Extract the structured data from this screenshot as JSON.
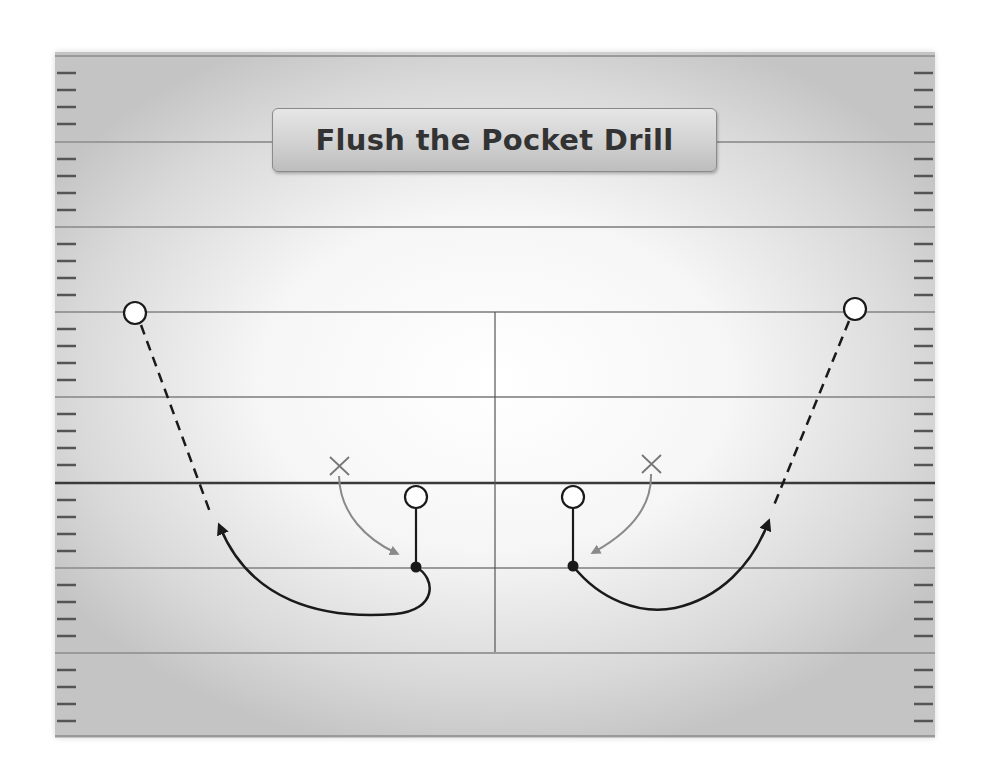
{
  "diagram": {
    "title": "Flush the Pocket Drill",
    "type": "football-drill",
    "colors": {
      "yard_line": "#9a9a9a",
      "scrimmage_line": "#3a3a3a",
      "hash": "#555555",
      "route": "#1a1a1a",
      "defender_path": "#8a8a8a",
      "player_outline": "#1a1a1a"
    },
    "field": {
      "yard_lines_y": [
        56,
        142,
        227,
        312,
        397,
        568,
        653,
        736
      ],
      "line_of_scrimmage_y": 483,
      "center_line": {
        "x": 495,
        "y1": 312,
        "y2": 652
      }
    },
    "players": [
      {
        "id": "left-receiver",
        "symbol": "O",
        "x": 135,
        "y": 313
      },
      {
        "id": "right-receiver",
        "symbol": "O",
        "x": 855,
        "y": 309
      },
      {
        "id": "left-quarterback",
        "symbol": "O",
        "x": 416,
        "y": 497
      },
      {
        "id": "right-quarterback",
        "symbol": "O",
        "x": 573,
        "y": 497
      },
      {
        "id": "left-defender",
        "symbol": "X",
        "x": 340,
        "y": 466
      },
      {
        "id": "right-defender",
        "symbol": "X",
        "x": 652,
        "y": 464
      }
    ],
    "routes": [
      {
        "id": "left-qb-drop",
        "style": "solid",
        "from": "left-quarterback",
        "to": [
          416,
          567
        ]
      },
      {
        "id": "right-qb-drop",
        "style": "solid",
        "from": "right-quarterback",
        "to": [
          573,
          566
        ]
      },
      {
        "id": "left-qb-scramble",
        "style": "solid-arrow",
        "description": "QB rolls out left after drop"
      },
      {
        "id": "right-qb-scramble",
        "style": "solid-arrow",
        "description": "QB rolls out right after drop"
      },
      {
        "id": "left-pass",
        "style": "dashed",
        "description": "Throw to left receiver"
      },
      {
        "id": "right-pass",
        "style": "dashed",
        "description": "Throw to right receiver"
      },
      {
        "id": "left-rush",
        "style": "gray-arrow",
        "description": "Defender pressure toward QB"
      },
      {
        "id": "right-rush",
        "style": "gray-arrow",
        "description": "Defender pressure toward QB"
      }
    ]
  }
}
